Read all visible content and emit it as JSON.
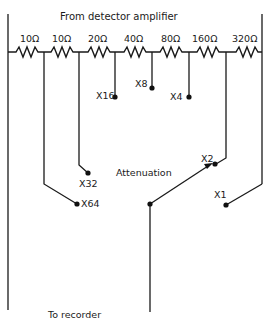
{
  "diagram": {
    "title_top": "From detector amplifier",
    "title_bottom": "To recorder",
    "center_label": "Attenuation",
    "resistors": [
      {
        "label": "10Ω",
        "value_ohms": 10
      },
      {
        "label": "10Ω",
        "value_ohms": 10
      },
      {
        "label": "20Ω",
        "value_ohms": 20
      },
      {
        "label": "40Ω",
        "value_ohms": 40
      },
      {
        "label": "80Ω",
        "value_ohms": 80
      },
      {
        "label": "160Ω",
        "value_ohms": 160
      },
      {
        "label": "320Ω",
        "value_ohms": 320
      }
    ],
    "taps": [
      {
        "label": "X64"
      },
      {
        "label": "X32"
      },
      {
        "label": "X16"
      },
      {
        "label": "X8"
      },
      {
        "label": "X4"
      },
      {
        "label": "X2"
      },
      {
        "label": "X1"
      }
    ],
    "selected_tap": "X2",
    "colors": {
      "ink": "#1a1a1a",
      "background": "#ffffff"
    }
  }
}
